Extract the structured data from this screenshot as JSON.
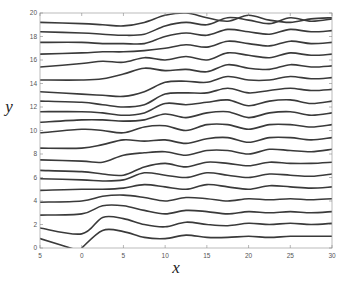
{
  "chart_data": {
    "type": "line",
    "title": "",
    "xlabel": "x",
    "ylabel": "y",
    "xlim": [
      -5,
      30
    ],
    "ylim": [
      0,
      20
    ],
    "xticks": [
      -5,
      0,
      5,
      10,
      15,
      20,
      25,
      30
    ],
    "yticks": [
      0,
      2,
      4,
      6,
      8,
      10,
      12,
      14,
      16,
      18,
      20
    ],
    "xtick_labels": [
      "5",
      "0",
      "5",
      "10",
      "15",
      "20",
      "25",
      "30"
    ],
    "ytick_labels": [
      "0",
      "2",
      "4",
      "6",
      "8",
      "10",
      "12",
      "14",
      "16",
      "18",
      "20"
    ],
    "grid": false,
    "legend": null,
    "x": [
      -5,
      0,
      2.5,
      5,
      7.5,
      10,
      12.5,
      15,
      17.5,
      20,
      22.5,
      25,
      27.5,
      30
    ],
    "series": [
      {
        "name": "streamline-1",
        "values": [
          0.8,
          -0.3,
          null,
          null,
          null,
          null,
          null,
          null,
          null,
          null,
          null,
          null,
          null,
          null
        ]
      },
      {
        "name": "streamline-2",
        "values": [
          null,
          0.0,
          1.5,
          1.4,
          0.9,
          0.8,
          1.1,
          0.9,
          0.9,
          1.0,
          0.9,
          1.0,
          1.0,
          1.0
        ]
      },
      {
        "name": "streamline-3",
        "values": [
          1.7,
          1.2,
          2.6,
          2.5,
          2.0,
          1.8,
          2.2,
          2.0,
          1.9,
          2.1,
          2.0,
          2.1,
          2.0,
          2.1
        ]
      },
      {
        "name": "streamline-4",
        "values": [
          2.8,
          2.9,
          3.6,
          3.6,
          3.2,
          2.9,
          3.2,
          3.1,
          2.9,
          3.1,
          3.0,
          3.1,
          3.0,
          3.1
        ]
      },
      {
        "name": "streamline-5",
        "values": [
          3.9,
          4.0,
          4.4,
          4.5,
          4.3,
          4.0,
          4.3,
          4.2,
          4.0,
          4.2,
          4.1,
          4.2,
          4.1,
          4.2
        ]
      },
      {
        "name": "streamline-6",
        "values": [
          4.9,
          5.0,
          5.0,
          5.1,
          5.4,
          5.2,
          5.0,
          5.4,
          5.2,
          5.0,
          5.3,
          5.2,
          5.1,
          5.2
        ]
      },
      {
        "name": "streamline-7",
        "values": [
          5.9,
          5.8,
          5.7,
          5.8,
          6.4,
          6.2,
          6.0,
          6.4,
          6.2,
          6.0,
          6.3,
          6.2,
          6.1,
          6.3
        ]
      },
      {
        "name": "streamline-8",
        "values": [
          6.6,
          6.5,
          6.3,
          6.2,
          6.9,
          7.2,
          6.9,
          7.3,
          7.2,
          7.0,
          7.3,
          7.2,
          7.2,
          7.3
        ]
      },
      {
        "name": "streamline-9",
        "values": [
          7.5,
          7.4,
          7.3,
          7.9,
          8.1,
          8.2,
          7.9,
          8.3,
          8.3,
          8.0,
          8.4,
          8.3,
          8.2,
          8.4
        ]
      },
      {
        "name": "streamline-10",
        "values": [
          8.5,
          8.5,
          8.8,
          9.2,
          9.1,
          9.2,
          8.9,
          9.3,
          9.4,
          9.0,
          9.4,
          9.4,
          9.2,
          9.4
        ]
      },
      {
        "name": "streamline-11",
        "values": [
          9.8,
          10.1,
          10.0,
          9.8,
          10.3,
          10.4,
          10.0,
          10.5,
          10.5,
          10.1,
          10.5,
          10.5,
          10.3,
          10.5
        ]
      },
      {
        "name": "streamline-12",
        "values": [
          10.7,
          10.9,
          10.9,
          10.8,
          10.9,
          11.4,
          11.1,
          11.5,
          11.6,
          11.1,
          11.5,
          11.6,
          11.3,
          11.5
        ]
      },
      {
        "name": "streamline-13",
        "values": [
          11.6,
          11.6,
          11.5,
          11.3,
          11.5,
          12.3,
          12.2,
          12.4,
          12.6,
          12.1,
          12.5,
          12.6,
          12.3,
          12.5
        ]
      },
      {
        "name": "streamline-14",
        "values": [
          12.5,
          12.4,
          12.2,
          12.0,
          12.2,
          13.1,
          13.2,
          13.2,
          13.6,
          13.2,
          13.4,
          13.6,
          13.4,
          13.5
        ]
      },
      {
        "name": "streamline-15",
        "values": [
          13.3,
          13.1,
          13.0,
          12.9,
          13.3,
          14.1,
          14.2,
          14.1,
          14.6,
          14.3,
          14.3,
          14.6,
          14.4,
          14.5
        ]
      },
      {
        "name": "streamline-16",
        "values": [
          14.3,
          14.3,
          14.4,
          14.8,
          15.3,
          15.1,
          15.2,
          15.0,
          15.6,
          15.3,
          15.2,
          15.6,
          15.4,
          15.5
        ]
      },
      {
        "name": "streamline-17",
        "values": [
          15.4,
          15.7,
          15.9,
          15.8,
          16.2,
          16.0,
          16.3,
          16.0,
          16.6,
          16.4,
          16.2,
          16.6,
          16.4,
          16.5
        ]
      },
      {
        "name": "streamline-18",
        "values": [
          16.5,
          16.6,
          16.7,
          16.7,
          16.8,
          17.0,
          17.3,
          17.1,
          17.6,
          17.4,
          17.2,
          17.6,
          17.4,
          17.5
        ]
      },
      {
        "name": "streamline-19",
        "values": [
          17.5,
          17.5,
          17.4,
          17.4,
          17.4,
          18.0,
          18.3,
          18.1,
          18.6,
          18.4,
          18.2,
          18.6,
          18.4,
          18.5
        ]
      },
      {
        "name": "streamline-20",
        "values": [
          18.4,
          18.3,
          18.2,
          18.1,
          18.2,
          18.9,
          19.2,
          19.0,
          19.6,
          19.4,
          19.1,
          19.6,
          19.3,
          19.5
        ]
      },
      {
        "name": "streamline-21",
        "values": [
          19.2,
          19.1,
          19.0,
          18.9,
          19.2,
          19.8,
          20.0,
          19.6,
          19.3,
          19.8,
          19.4,
          19.2,
          19.5,
          19.6
        ]
      }
    ]
  }
}
